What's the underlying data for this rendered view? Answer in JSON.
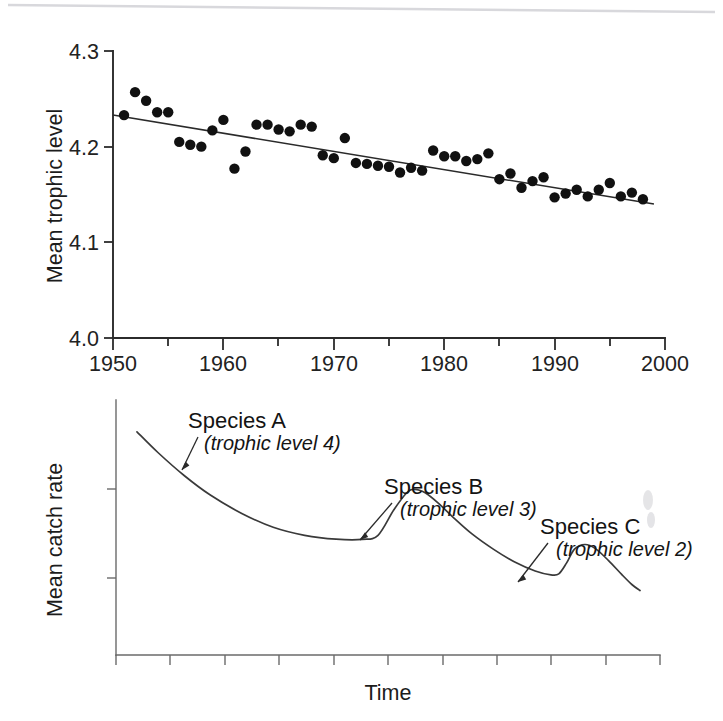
{
  "figure": {
    "background": "#ffffff",
    "ink_color": "#1a1a1a",
    "panel_count": 2
  },
  "chart_data": [
    {
      "id": "upper-panel",
      "type": "scatter",
      "title": "",
      "subtitle": "",
      "xlabel": "",
      "ylabel": "Mean trophic level",
      "xlim": [
        1950,
        2000
      ],
      "ylim": [
        4.0,
        4.3
      ],
      "grid": false,
      "legend_position": "none",
      "x_ticklabels": [
        "1950",
        "1960",
        "1970",
        "1980",
        "1990",
        "2000"
      ],
      "x_majorticks": [
        1950,
        1960,
        1970,
        1980,
        1990,
        2000
      ],
      "x_minorticks": [
        1955,
        1965,
        1975,
        1985,
        1995
      ],
      "y_ticklabels": [
        "4.0",
        "4.1",
        "4.2",
        "4.3"
      ],
      "y_majorticks": [
        4.0,
        4.1,
        4.2,
        4.3
      ],
      "marker": "filled-circle",
      "marker_color": "#111111",
      "marker_radius": 5.2,
      "trendline": {
        "type": "linear-regression",
        "color": "#2a2a2a",
        "x_start": 1950,
        "y_start": 4.233,
        "x_end": 1999,
        "y_end": 4.14
      },
      "x": [
        1951,
        1952,
        1953,
        1954,
        1955,
        1956,
        1957,
        1958,
        1959,
        1960,
        1961,
        1962,
        1963,
        1964,
        1965,
        1966,
        1967,
        1968,
        1969,
        1970,
        1971,
        1972,
        1973,
        1974,
        1975,
        1976,
        1977,
        1978,
        1979,
        1980,
        1981,
        1982,
        1983,
        1984,
        1985,
        1986,
        1987,
        1988,
        1989,
        1990,
        1991,
        1992,
        1993,
        1994,
        1995,
        1996,
        1997,
        1998
      ],
      "y": [
        4.233,
        4.257,
        4.248,
        4.236,
        4.236,
        4.205,
        4.202,
        4.2,
        4.217,
        4.228,
        4.177,
        4.195,
        4.223,
        4.223,
        4.218,
        4.216,
        4.223,
        4.221,
        4.191,
        4.188,
        4.209,
        4.183,
        4.182,
        4.18,
        4.179,
        4.173,
        4.178,
        4.175,
        4.196,
        4.19,
        4.19,
        4.185,
        4.187,
        4.193,
        4.166,
        4.172,
        4.157,
        4.164,
        4.168,
        4.147,
        4.151,
        4.155,
        4.148,
        4.155,
        4.162,
        4.148,
        4.152,
        4.145
      ],
      "n_points": 48
    },
    {
      "id": "lower-panel",
      "type": "line",
      "title": "",
      "xlabel": "Time",
      "ylabel": "Mean catch rate",
      "grid": false,
      "legend_position": "none",
      "x_ticklabels": [
        "",
        "",
        "",
        "",
        "",
        "",
        "",
        "",
        "",
        ""
      ],
      "y_ticklabels": [
        "",
        ""
      ],
      "axis_values_shown": false,
      "description": "Schematic declining catch rate with successive peaks as fisheries shift to lower trophic levels",
      "series": [
        {
          "name": "mean catch rate",
          "color": "#3a3a3a",
          "x": [
            0.04,
            0.08,
            0.13,
            0.18,
            0.24,
            0.3,
            0.36,
            0.42,
            0.47,
            0.5,
            0.53,
            0.555,
            0.57,
            0.59,
            0.615,
            0.645,
            0.68,
            0.72,
            0.76,
            0.8,
            0.83,
            0.845,
            0.86,
            0.875,
            0.895,
            0.915,
            0.94,
            0.965,
            0.985,
            1.0
          ],
          "y": [
            0.94,
            0.85,
            0.75,
            0.665,
            0.585,
            0.525,
            0.49,
            0.473,
            0.472,
            0.49,
            0.6,
            0.675,
            0.69,
            0.675,
            0.63,
            0.565,
            0.495,
            0.43,
            0.375,
            0.335,
            0.318,
            0.322,
            0.37,
            0.43,
            0.45,
            0.432,
            0.38,
            0.32,
            0.275,
            0.25
          ]
        }
      ],
      "annotations": [
        {
          "id": "species-a",
          "label": "Species A",
          "sublabel": "(trophic level 4)",
          "points_to": "first descending limb"
        },
        {
          "id": "species-b",
          "label": "Species B",
          "sublabel": "(trophic level 3)",
          "points_to": "second descending limb after first peak"
        },
        {
          "id": "species-c",
          "label": "Species C",
          "sublabel": "(trophic level 2)",
          "points_to": "third descending limb after second peak"
        }
      ]
    }
  ],
  "upper": {
    "ylabel": "Mean trophic level",
    "yticks": [
      "4.3",
      "4.2",
      "4.1",
      "4.0"
    ],
    "xticks": [
      "1950",
      "1960",
      "1970",
      "1980",
      "1990",
      "2000"
    ]
  },
  "lower": {
    "ylabel": "Mean catch rate",
    "xlabel": "Time",
    "annotations": [
      {
        "label": "Species A",
        "sublabel": "(trophic level 4)"
      },
      {
        "label": "Species B",
        "sublabel": "(trophic level 3)"
      },
      {
        "label": "Species C",
        "sublabel": "(trophic level 2)"
      }
    ]
  }
}
